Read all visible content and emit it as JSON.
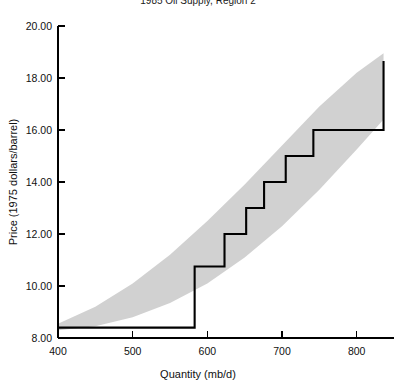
{
  "chart_data": {
    "type": "line",
    "title": "1985 Oil Supply, Region 2",
    "xlabel": "Quantity (mb/d)",
    "ylabel": "Price (1975 dollars/barrel)",
    "xlim": [
      400,
      850
    ],
    "ylim": [
      8.0,
      20.0
    ],
    "grid": false,
    "legend": null,
    "x_ticks": [
      400,
      500,
      600,
      700,
      800
    ],
    "x_tick_labels": [
      "400",
      "500",
      "600",
      "700",
      "800"
    ],
    "y_ticks": [
      8.0,
      10.0,
      12.0,
      14.0,
      16.0,
      18.0,
      20.0
    ],
    "y_tick_labels": [
      "8.00",
      "10.00",
      "12.00",
      "14.00",
      "16.00",
      "18.00",
      "20.00"
    ],
    "series": [
      {
        "name": "Supply step curve",
        "style": "step-post",
        "color": "#000000",
        "x": [
          400,
          583,
          583,
          623,
          623,
          652,
          652,
          676,
          676,
          705,
          705,
          742,
          742,
          836,
          836
        ],
        "y": [
          8.4,
          8.4,
          10.75,
          10.75,
          12.0,
          12.0,
          13.0,
          13.0,
          14.0,
          14.0,
          15.0,
          15.0,
          16.0,
          16.0,
          18.65
        ]
      },
      {
        "name": "Uncertainty band upper bound",
        "style": "band-edge",
        "color": "#c9c9c9",
        "x": [
          400,
          450,
          500,
          550,
          600,
          650,
          700,
          750,
          800,
          836
        ],
        "y": [
          8.55,
          9.2,
          10.1,
          11.2,
          12.5,
          13.9,
          15.4,
          16.9,
          18.2,
          18.95
        ]
      },
      {
        "name": "Uncertainty band lower bound",
        "style": "band-edge",
        "color": "#c9c9c9",
        "x": [
          400,
          450,
          500,
          550,
          600,
          650,
          700,
          750,
          800,
          836
        ],
        "y": [
          8.3,
          8.45,
          8.8,
          9.35,
          10.1,
          11.1,
          12.3,
          13.7,
          15.25,
          16.4
        ]
      }
    ],
    "step_levels": [
      8.4,
      10.75,
      12.0,
      13.0,
      14.0,
      15.0,
      16.0,
      18.65
    ],
    "step_breakpoints": [
      583,
      623,
      652,
      676,
      705,
      742,
      836
    ]
  }
}
